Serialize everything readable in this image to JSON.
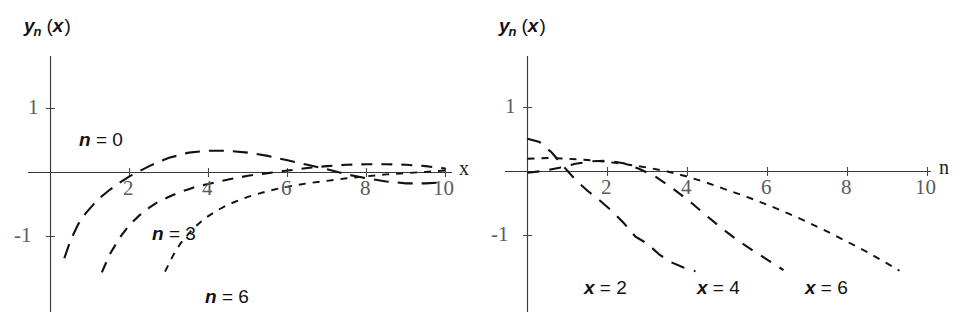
{
  "figure": {
    "width": 973,
    "height": 319,
    "background": "#ffffff",
    "stroke_color": "#111111",
    "axis_color": "#3a3a3a",
    "tick_label_color": "#5a5a5a"
  },
  "panels": [
    {
      "id": "left",
      "ylabel_main": "y",
      "ylabel_sub": "n",
      "ylabel_arg": "(x)",
      "ylabel_arg_open": "(",
      "ylabel_arg_var": "x",
      "ylabel_arg_close": ")",
      "xaxis_name": "x",
      "xticks": [
        "2",
        "4",
        "6",
        "8",
        "10"
      ],
      "yticks": [
        "1",
        "-1"
      ],
      "curve_labels": [
        "n = 0",
        "n = 3",
        "n = 6"
      ],
      "curve_label_parts": [
        {
          "var": "n",
          "rest": " = 0"
        },
        {
          "var": "n",
          "rest": " = 3"
        },
        {
          "var": "n",
          "rest": " = 6"
        }
      ]
    },
    {
      "id": "right",
      "ylabel_main": "y",
      "ylabel_sub": "n",
      "ylabel_arg": "(x)",
      "ylabel_arg_open": "(",
      "ylabel_arg_var": "x",
      "ylabel_arg_close": ")",
      "xaxis_name": "n",
      "xticks": [
        "2",
        "4",
        "6",
        "8",
        "10"
      ],
      "yticks": [
        "1",
        "-1"
      ],
      "curve_labels": [
        "x = 2",
        "x = 4",
        "x = 6"
      ],
      "curve_label_parts": [
        {
          "var": "x",
          "rest": " = 2"
        },
        {
          "var": "x",
          "rest": " = 4"
        },
        {
          "var": "x",
          "rest": " = 6"
        }
      ]
    }
  ],
  "chart_data": [
    {
      "type": "line",
      "panel": "left",
      "title": "",
      "xlabel": "x",
      "ylabel": "y_n (x)",
      "xlim": [
        0,
        10.4
      ],
      "ylim": [
        -1.55,
        1.45
      ],
      "xticks": [
        2,
        4,
        6,
        8,
        10
      ],
      "yticks": [
        1,
        -1
      ],
      "grid": false,
      "legend": "inline-labels",
      "series": [
        {
          "name": "n = 0",
          "dash": "long",
          "x": [
            0.35,
            0.5,
            0.7,
            0.9,
            1.1,
            1.3,
            1.5,
            1.75,
            2.0,
            2.25,
            2.5,
            2.75,
            3.0,
            3.5,
            4.0,
            4.5,
            5.0,
            5.5,
            6.0,
            6.5,
            7.0,
            7.5,
            8.0,
            8.5,
            9.0,
            9.5,
            10.0
          ],
          "y": [
            -1.34,
            -1.07,
            -0.81,
            -0.63,
            -0.49,
            -0.37,
            -0.27,
            -0.16,
            -0.06,
            0.02,
            0.1,
            0.17,
            0.23,
            0.31,
            0.34,
            0.34,
            0.31,
            0.26,
            0.19,
            0.12,
            0.05,
            -0.03,
            -0.09,
            -0.14,
            -0.17,
            -0.17,
            -0.15
          ]
        },
        {
          "name": "n = 3",
          "dash": "medium",
          "x": [
            1.3,
            1.5,
            1.75,
            2.0,
            2.25,
            2.5,
            2.75,
            3.0,
            3.25,
            3.5,
            3.75,
            4.0,
            4.5,
            5.0,
            5.5,
            6.0,
            6.5,
            7.0,
            7.5,
            8.0,
            8.5,
            9.0,
            9.5,
            10.0
          ],
          "y": [
            -1.56,
            -1.28,
            -1.02,
            -0.82,
            -0.67,
            -0.55,
            -0.45,
            -0.38,
            -0.31,
            -0.26,
            -0.21,
            -0.18,
            -0.11,
            -0.05,
            -0.01,
            0.03,
            0.07,
            0.1,
            0.12,
            0.13,
            0.13,
            0.12,
            0.1,
            0.06
          ]
        },
        {
          "name": "n = 6",
          "dash": "short",
          "x": [
            2.9,
            3.1,
            3.3,
            3.6,
            3.9,
            4.2,
            4.5,
            5.0,
            5.5,
            6.0,
            6.5,
            7.0,
            7.5,
            8.0,
            8.5,
            9.0,
            9.5,
            10.0
          ],
          "y": [
            -1.55,
            -1.3,
            -1.1,
            -0.88,
            -0.72,
            -0.6,
            -0.5,
            -0.38,
            -0.29,
            -0.22,
            -0.17,
            -0.13,
            -0.09,
            -0.06,
            -0.03,
            -0.01,
            0.01,
            0.03
          ]
        }
      ]
    },
    {
      "type": "line",
      "panel": "right",
      "title": "",
      "xlabel": "n",
      "ylabel": "y_n (x)",
      "xlim": [
        0,
        10.4
      ],
      "ylim": [
        -1.55,
        1.45
      ],
      "xticks": [
        2,
        4,
        6,
        8,
        10
      ],
      "yticks": [
        1,
        -1
      ],
      "grid": false,
      "legend": "inline-labels",
      "series": [
        {
          "name": "x = 2",
          "dash": "long",
          "x": [
            0,
            0.3,
            0.6,
            0.9,
            1.2,
            1.5,
            1.8,
            2.1,
            2.4,
            2.7,
            3.0,
            3.3,
            3.6,
            3.9,
            4.2
          ],
          "y": [
            0.51,
            0.46,
            0.3,
            0.08,
            -0.13,
            -0.3,
            -0.45,
            -0.61,
            -0.8,
            -1.02,
            -1.13,
            -1.3,
            -1.42,
            -1.5,
            -1.56
          ]
        },
        {
          "name": "x = 4",
          "dash": "long",
          "x": [
            0,
            0.4,
            0.8,
            1.2,
            1.6,
            2.0,
            2.4,
            2.8,
            3.2,
            3.6,
            4.0,
            4.4,
            4.8,
            5.2,
            5.6,
            6.0,
            6.4
          ],
          "y": [
            -0.02,
            0.01,
            0.06,
            0.12,
            0.16,
            0.17,
            0.13,
            0.04,
            -0.08,
            -0.25,
            -0.44,
            -0.65,
            -0.86,
            -1.05,
            -1.22,
            -1.38,
            -1.54
          ]
        },
        {
          "name": "x = 6",
          "dash": "short",
          "x": [
            0,
            0.5,
            1.0,
            1.5,
            2.0,
            2.5,
            3.0,
            3.5,
            4.0,
            4.5,
            5.0,
            5.5,
            6.0,
            6.5,
            7.0,
            7.5,
            8.0,
            8.5,
            9.0,
            9.3
          ],
          "y": [
            0.2,
            0.21,
            0.2,
            0.18,
            0.15,
            0.11,
            0.06,
            0.0,
            -0.08,
            -0.18,
            -0.29,
            -0.4,
            -0.52,
            -0.65,
            -0.79,
            -0.94,
            -1.1,
            -1.26,
            -1.44,
            -1.55
          ]
        }
      ]
    }
  ]
}
